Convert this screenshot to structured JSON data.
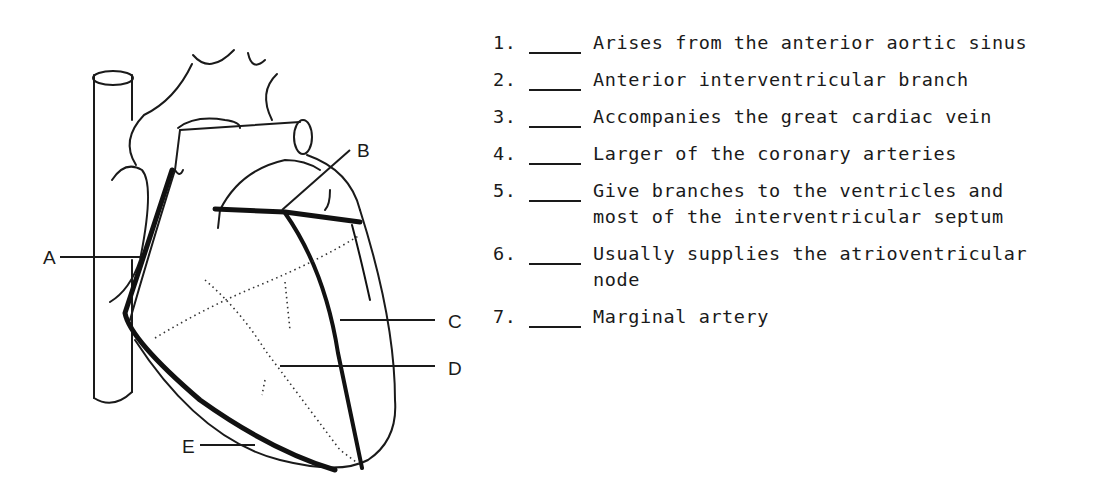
{
  "diagram": {
    "labels": [
      "A",
      "B",
      "C",
      "D",
      "E"
    ]
  },
  "questions": [
    {
      "number": "1.",
      "blank": "",
      "text": "Arises from the anterior aortic sinus"
    },
    {
      "number": "2.",
      "blank": "",
      "text": "Anterior interventricular branch"
    },
    {
      "number": "3.",
      "blank": "",
      "text": "Accompanies the great cardiac vein"
    },
    {
      "number": "4.",
      "blank": "",
      "text": "Larger of the coronary arteries"
    },
    {
      "number": "5.",
      "blank": "",
      "text": "Give branches to the ventricles and most of the interventricular septum"
    },
    {
      "number": "6.",
      "blank": "",
      "text": "Usually supplies the atrioventricular node"
    },
    {
      "number": "7.",
      "blank": "",
      "text": "Marginal artery"
    }
  ]
}
